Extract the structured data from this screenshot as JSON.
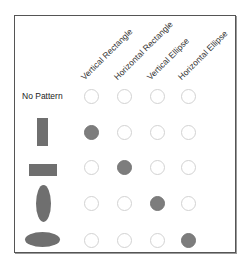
{
  "columns": [
    {
      "label": "Vertical Rectangle",
      "x": 91
    },
    {
      "label": "Horizontal Rectangle",
      "x": 124
    },
    {
      "label": "Vertical Ellipse",
      "x": 157
    },
    {
      "label": "Horizontal Ellipse",
      "x": 188
    }
  ],
  "rows": [
    {
      "label": "No Pattern",
      "shape": "none",
      "y": 96,
      "filled_col": -1
    },
    {
      "label": "",
      "shape": "vertical-rectangle",
      "y": 132,
      "filled_col": 0
    },
    {
      "label": "",
      "shape": "horizontal-rectangle",
      "y": 167,
      "filled_col": 1
    },
    {
      "label": "",
      "shape": "vertical-ellipse",
      "y": 203,
      "filled_col": 2
    },
    {
      "label": "",
      "shape": "horizontal-ellipse",
      "y": 240,
      "filled_col": 3
    }
  ],
  "colors": {
    "shape_fill": "#6f6f6f",
    "filled_cell": "#7d7d7d",
    "empty_cell_border": "#d2d2d2",
    "frame_border": "#555555"
  }
}
